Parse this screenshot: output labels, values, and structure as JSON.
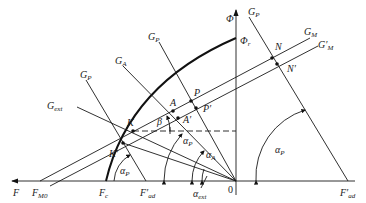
{
  "diagram": {
    "type": "phasor-vector-diagram",
    "axes": {
      "vertical": {
        "label": "Φ",
        "top_label": "Φ_r"
      },
      "horizontal": {
        "label": "F",
        "origin_label": "0"
      }
    },
    "lines": [
      {
        "name": "G_P",
        "text": "G",
        "sub": "P"
      },
      {
        "name": "G_A",
        "text": "G",
        "sub": "A"
      },
      {
        "name": "G_P_left",
        "text": "G",
        "sub": "P"
      },
      {
        "name": "G_ext",
        "text": "G",
        "sub": "ext"
      },
      {
        "name": "G_P_right",
        "text": "G",
        "sub": "P"
      },
      {
        "name": "G_M",
        "text": "G",
        "sub": "M"
      },
      {
        "name": "G'_M",
        "text": "G′",
        "sub": "M"
      }
    ],
    "points": [
      {
        "name": "N",
        "text": "N"
      },
      {
        "name": "N'",
        "text": "N′"
      },
      {
        "name": "P",
        "text": "P"
      },
      {
        "name": "P'",
        "text": "P′"
      },
      {
        "name": "A",
        "text": "A"
      },
      {
        "name": "A'",
        "text": "A′"
      },
      {
        "name": "K",
        "text": "K"
      },
      {
        "name": "K'",
        "text": "K′"
      }
    ],
    "axis_labels": {
      "F": "F",
      "F_M0": {
        "text": "F",
        "sub": "M0"
      },
      "F_c": {
        "text": "F",
        "sub": "c"
      },
      "F'_ad_left": {
        "text": "F′",
        "sub": "ad"
      },
      "F'_ad_right": {
        "text": "F′",
        "sub": "ad"
      },
      "origin": "0"
    },
    "angles": [
      {
        "name": "beta",
        "text": "β"
      },
      {
        "name": "alpha_P_left",
        "text": "α",
        "sub": "P"
      },
      {
        "name": "alpha_P_center",
        "text": "α",
        "sub": "P"
      },
      {
        "name": "alpha_A",
        "text": "α",
        "sub": "A"
      },
      {
        "name": "alpha_ext",
        "text": "α",
        "sub": "ext"
      },
      {
        "name": "alpha_P_right",
        "text": "α",
        "sub": "P"
      }
    ]
  }
}
